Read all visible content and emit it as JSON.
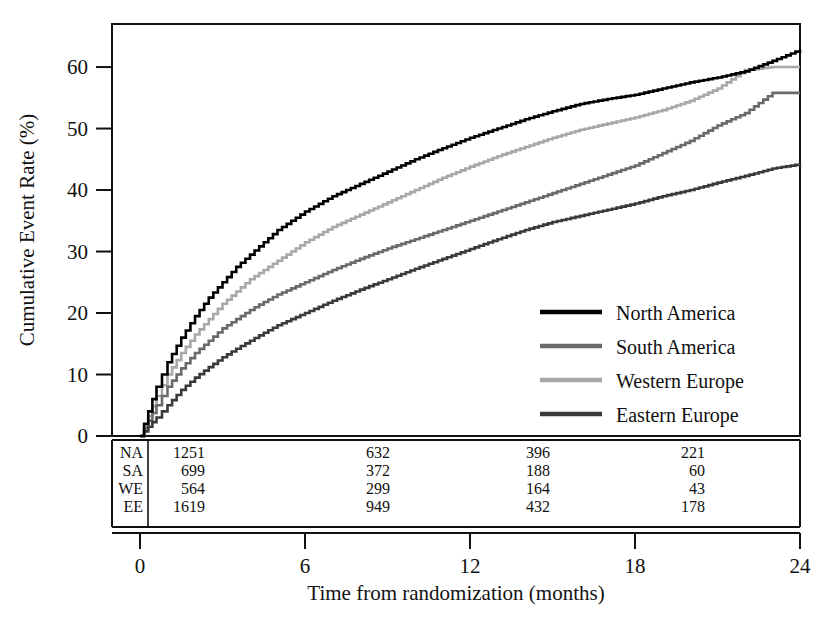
{
  "chart_data": {
    "type": "line",
    "title": "",
    "subtitle": "",
    "xlabel": "Time from randomization (months)",
    "ylabel": "Cumulative Event Rate (%)",
    "xlim": [
      0,
      24
    ],
    "ylim": [
      0,
      67
    ],
    "x_ticks": [
      0,
      6,
      12,
      18,
      24
    ],
    "x_tick_labels": [
      "0",
      "6",
      "12",
      "18",
      "24"
    ],
    "y_ticks": [
      0,
      10,
      20,
      30,
      40,
      50,
      60
    ],
    "y_tick_labels": [
      "0",
      "10",
      "20",
      "30",
      "40",
      "50",
      "60"
    ],
    "grid": false,
    "legend_position": "center-right",
    "style": "kaplan-meier cumulative incidence step curves",
    "series": [
      {
        "name": "North America",
        "short": "NA",
        "color": "#000000",
        "x": [
          0,
          0.3,
          0.6,
          1,
          1.5,
          2,
          2.5,
          3,
          3.5,
          4,
          4.5,
          5,
          5.5,
          6,
          7,
          8,
          9,
          10,
          11,
          12,
          13,
          14,
          15,
          16,
          17,
          18,
          19,
          20,
          21,
          22,
          23,
          24
        ],
        "values": [
          0,
          4,
          8,
          12,
          16,
          19.5,
          22.5,
          25,
          27.5,
          29.5,
          31.5,
          33.5,
          35,
          36.5,
          39,
          41,
          43,
          45,
          46.8,
          48.5,
          50,
          51.5,
          52.8,
          54,
          54.8,
          55.5,
          56.5,
          57.5,
          58.3,
          59.3,
          61,
          62.8
        ]
      },
      {
        "name": "South America",
        "short": "SA",
        "color": "#6a6a6a",
        "x": [
          0,
          0.3,
          0.6,
          1,
          1.5,
          2,
          2.5,
          3,
          3.5,
          4,
          4.5,
          5,
          5.5,
          6,
          7,
          8,
          9,
          10,
          11,
          12,
          13,
          14,
          15,
          16,
          17,
          18,
          19,
          20,
          21,
          22,
          23,
          24
        ],
        "values": [
          0,
          2.5,
          5,
          8,
          11,
          13.5,
          15.5,
          17.5,
          19,
          20.5,
          21.8,
          23,
          24,
          25,
          27,
          28.8,
          30.5,
          32,
          33.5,
          35,
          36.5,
          38,
          39.5,
          41,
          42.5,
          44,
          46,
          48,
          50.5,
          52.5,
          55.8,
          55.8
        ]
      },
      {
        "name": "Western Europe",
        "short": "WE",
        "color": "#a8a8a8",
        "x": [
          0,
          0.3,
          0.6,
          1,
          1.5,
          2,
          2.5,
          3,
          3.5,
          4,
          4.5,
          5,
          5.5,
          6,
          7,
          8,
          9,
          10,
          11,
          12,
          13,
          14,
          15,
          16,
          17,
          18,
          19,
          20,
          21,
          22,
          23,
          24
        ],
        "values": [
          0,
          3.2,
          6.5,
          10,
          13.5,
          16.5,
          19,
          21.5,
          23.5,
          25.5,
          27,
          28.5,
          30,
          31.5,
          34,
          36,
          38,
          40,
          42,
          43.8,
          45.5,
          47,
          48.5,
          49.8,
          50.8,
          51.8,
          53,
          54.5,
          56.5,
          59.5,
          60,
          60
        ]
      },
      {
        "name": "Eastern Europe",
        "short": "EE",
        "color": "#3a3a3a",
        "x": [
          0,
          0.3,
          0.6,
          1,
          1.5,
          2,
          2.5,
          3,
          3.5,
          4,
          4.5,
          5,
          5.5,
          6,
          7,
          8,
          9,
          10,
          11,
          12,
          13,
          14,
          15,
          16,
          17,
          18,
          19,
          20,
          21,
          22,
          23,
          24
        ],
        "values": [
          0,
          1.5,
          3,
          5,
          7.5,
          9.5,
          11.2,
          12.8,
          14.2,
          15.5,
          16.8,
          18,
          19,
          20,
          22,
          23.8,
          25.5,
          27.2,
          28.8,
          30.4,
          32,
          33.5,
          34.8,
          35.8,
          36.8,
          37.8,
          39,
          40,
          41.2,
          42.3,
          43.5,
          44.2
        ]
      }
    ],
    "numbers_at_risk": {
      "time_points": [
        0,
        6,
        12,
        18,
        24
      ],
      "visible_columns": [
        0,
        6,
        12,
        18
      ],
      "rows": [
        {
          "label": "NA",
          "values": [
            "1251",
            "632",
            "396",
            "221"
          ]
        },
        {
          "label": "SA",
          "values": [
            "699",
            "372",
            "188",
            "60"
          ]
        },
        {
          "label": "WE",
          "values": [
            "564",
            "299",
            "164",
            "43"
          ]
        },
        {
          "label": "EE",
          "values": [
            "1619",
            "949",
            "432",
            "178"
          ]
        }
      ]
    },
    "legend": [
      {
        "label": "North America",
        "color": "#000000"
      },
      {
        "label": "South America",
        "color": "#6a6a6a"
      },
      {
        "label": "Western Europe",
        "color": "#a8a8a8"
      },
      {
        "label": "Eastern Europe",
        "color": "#3a3a3a"
      }
    ]
  }
}
